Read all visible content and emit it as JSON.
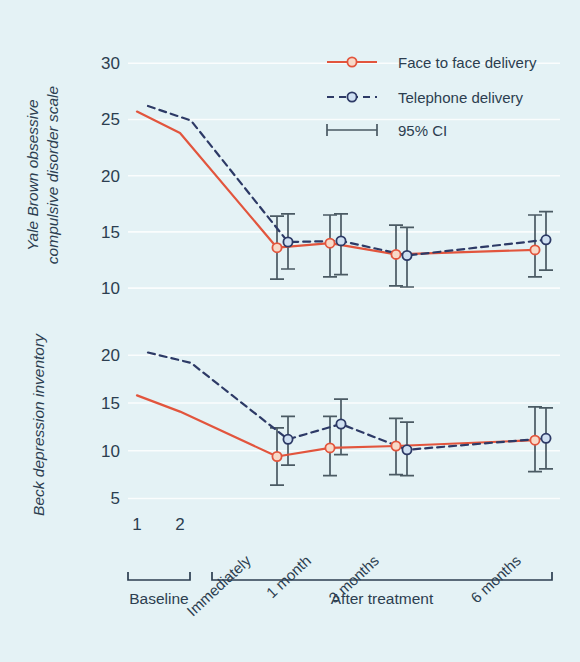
{
  "background_color": "#e4f2f5",
  "colors": {
    "face_to_face": "#e2553d",
    "telephone": "#2d3a66",
    "error_bar": "#4a5a63",
    "text": "#2c3e50",
    "gridline": "#ffffff"
  },
  "legend": {
    "items": [
      {
        "label": "Face to face delivery",
        "style": "solid-line-circle",
        "color": "#e2553d"
      },
      {
        "label": "Telephone delivery",
        "style": "dashed-line-circle",
        "color": "#2d3a66"
      },
      {
        "label": "95% CI",
        "style": "error-bar",
        "color": "#4a5a63"
      }
    ]
  },
  "x_groups": [
    {
      "label": "Baseline",
      "categories": [
        "1",
        "2"
      ]
    },
    {
      "label": "After treatment",
      "categories": [
        "Immediately",
        "1 month",
        "3 months",
        "6 months"
      ]
    }
  ],
  "chart_data": [
    {
      "type": "line",
      "panel": "top",
      "title": "",
      "ylabel": "Yale Brown obsessive compulsive disorder scale",
      "xlabel": "",
      "ylim": [
        8.5,
        31
      ],
      "yticks": [
        10,
        15,
        20,
        25,
        30
      ],
      "grid": true,
      "categories": [
        "1",
        "2",
        "Immediately",
        "1 month",
        "3 months",
        "6 months"
      ],
      "series": [
        {
          "name": "Face to face delivery",
          "color": "#e2553d",
          "linestyle": "solid",
          "values": [
            25.7,
            23.8,
            13.6,
            14.0,
            13.0,
            13.4
          ],
          "ci_low": [
            null,
            null,
            10.8,
            11.0,
            10.2,
            11.0
          ],
          "ci_high": [
            null,
            null,
            16.4,
            16.5,
            15.6,
            16.5
          ]
        },
        {
          "name": "Telephone delivery",
          "color": "#2d3a66",
          "linestyle": "dashed",
          "values": [
            26.2,
            24.9,
            14.1,
            14.2,
            12.9,
            14.3
          ],
          "ci_low": [
            null,
            null,
            11.7,
            11.2,
            10.1,
            11.6
          ],
          "ci_high": [
            null,
            null,
            16.6,
            16.6,
            15.4,
            16.8
          ]
        }
      ]
    },
    {
      "type": "line",
      "panel": "bottom",
      "title": "",
      "ylabel": "Beck depression inventory",
      "xlabel": "",
      "ylim": [
        4,
        21.5
      ],
      "yticks": [
        5,
        10,
        15,
        20
      ],
      "grid": true,
      "categories": [
        "1",
        "2",
        "Immediately",
        "1 month",
        "3 months",
        "6 months"
      ],
      "series": [
        {
          "name": "Face to face delivery",
          "color": "#e2553d",
          "linestyle": "solid",
          "values": [
            15.8,
            14.1,
            9.4,
            10.3,
            10.5,
            11.1
          ],
          "ci_low": [
            null,
            null,
            6.4,
            7.4,
            7.5,
            7.8
          ],
          "ci_high": [
            null,
            null,
            12.4,
            13.6,
            13.4,
            14.6
          ]
        },
        {
          "name": "Telephone delivery",
          "color": "#2d3a66",
          "linestyle": "dashed",
          "values": [
            20.3,
            19.2,
            11.2,
            12.8,
            10.1,
            11.3
          ],
          "ci_low": [
            null,
            null,
            8.5,
            9.6,
            7.4,
            8.1
          ],
          "ci_high": [
            null,
            null,
            13.6,
            15.4,
            13.0,
            14.5
          ]
        }
      ]
    }
  ]
}
